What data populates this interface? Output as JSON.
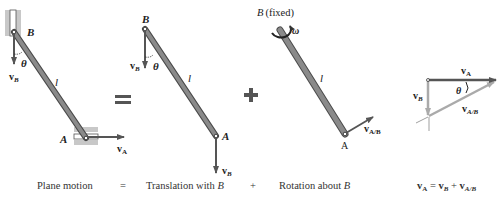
{
  "colors": {
    "rod_fill": "#8a8a8a",
    "rod_stroke": "#4a4a4a",
    "guide": "#c8c8c8",
    "arrow": "#555555",
    "light_arrow": "#aaaaaa",
    "text": "#222222"
  },
  "panels": {
    "plane_motion": {
      "point_B": "B",
      "point_A": "A",
      "length": "l",
      "angle": "θ",
      "v_B": "v",
      "v_B_sub": "B",
      "v_A": "v",
      "v_A_sub": "A"
    },
    "translation": {
      "point_B": "B",
      "point_A": "A",
      "length": "l",
      "angle": "θ",
      "v_B_top": "v",
      "v_B_top_sub": "B",
      "v_B_bottom": "v",
      "v_B_bottom_sub": "B"
    },
    "rotation": {
      "fixed_label_B": "B",
      "fixed_label_rest": "(fixed)",
      "omega": "ω",
      "length": "l",
      "point_A": "A",
      "v_AB": "v",
      "v_AB_sub": "A/B"
    },
    "vector_triangle": {
      "v_A": "v",
      "v_A_sub": "A",
      "v_B": "v",
      "v_B_sub": "B",
      "v_AB": "v",
      "v_AB_sub": "A/B",
      "angle": "θ"
    }
  },
  "operators": {
    "equals": "=",
    "plus": "+"
  },
  "captions": {
    "plane_motion": "Plane motion",
    "eq": "=",
    "translation_prefix": "Translation with ",
    "translation_B": "B",
    "plus": "+",
    "rotation_prefix": "Rotation about ",
    "rotation_B": "B",
    "equation": {
      "vA": "v",
      "vA_sub": "A",
      "eq": " = ",
      "vB": "v",
      "vB_sub": "B",
      "plus": " + ",
      "vAB": "v",
      "vAB_sub": "A/B"
    }
  }
}
